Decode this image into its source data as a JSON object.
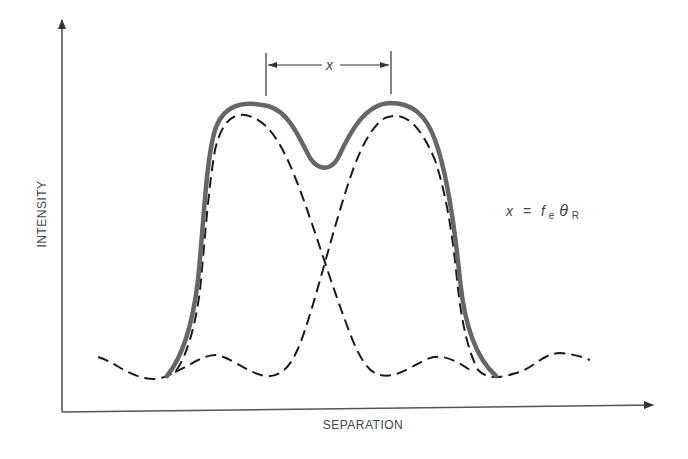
{
  "diagram": {
    "type": "intensity-profile",
    "axes": {
      "x_label": "SEPARATION",
      "y_label": "INTENSITY"
    },
    "separation_marker": {
      "label": "x"
    },
    "equation": {
      "lhs": "x",
      "equals": "=",
      "f": "f",
      "f_sub": "e",
      "theta": "θ",
      "theta_sub": "R"
    },
    "colors": {
      "axis": "#555555",
      "sum_curve": "#666666",
      "component_curves": "#1a1a1a",
      "text": "#444444"
    }
  }
}
